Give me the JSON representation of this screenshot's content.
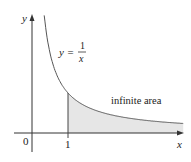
{
  "chart_data": {
    "type": "area",
    "title": "",
    "function": "y = 1/x",
    "xlabel": "x",
    "ylabel": "y",
    "x_ticks": [
      {
        "value": 0,
        "label": "0"
      },
      {
        "value": 1,
        "label": "1"
      }
    ],
    "shaded_region": {
      "from": 1,
      "to": "infinity",
      "label": "infinite area"
    },
    "x_range": [
      0,
      4.2
    ],
    "grid": false,
    "equation_label": {
      "lhs": "y =",
      "numerator": "1",
      "denominator": "x"
    }
  },
  "colors": {
    "curve": "#555555",
    "fill": "#e6e6e6",
    "axis": "#333333"
  }
}
